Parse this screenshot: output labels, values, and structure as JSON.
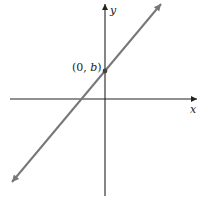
{
  "diagram": {
    "type": "coordinate-plane-line",
    "x_axis_label": "x",
    "y_axis_label": "y",
    "intercept_label_open": "(0, ",
    "intercept_label_var": "b",
    "intercept_label_close": ")",
    "colors": {
      "axes": "#222222",
      "line": "#777777",
      "point": "#444444",
      "background": "#ffffff"
    }
  }
}
